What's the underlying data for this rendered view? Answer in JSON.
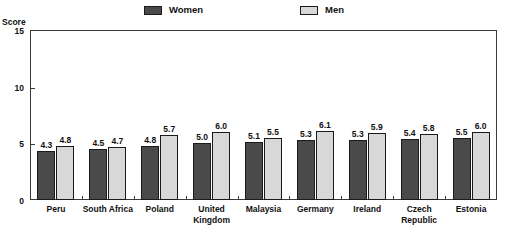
{
  "chart_data": {
    "type": "bar",
    "title": "",
    "subtitle": "",
    "xlabel": "",
    "ylabel": "Score",
    "ylim": [
      0,
      15
    ],
    "yticks": [
      0,
      5,
      10,
      15
    ],
    "ytick_labels": [
      "0",
      "5",
      "10",
      "15"
    ],
    "grid": false,
    "legend_position": "top-center",
    "categories": [
      "Peru",
      "South Africa",
      "Poland",
      "United Kingdom",
      "Malaysia",
      "Germany",
      "Ireland",
      "Czech Republic",
      "Estonia"
    ],
    "category_lines": [
      [
        "Peru"
      ],
      [
        "South Africa"
      ],
      [
        "Poland"
      ],
      [
        "United",
        "Kingdom"
      ],
      [
        "Malaysia"
      ],
      [
        "Germany"
      ],
      [
        "Ireland"
      ],
      [
        "Czech",
        "Republic"
      ],
      [
        "Estonia"
      ]
    ],
    "series": [
      {
        "name": "Women",
        "color": "#4a4a4a",
        "values": [
          4.3,
          4.5,
          4.8,
          5.0,
          5.1,
          5.3,
          5.3,
          5.4,
          5.5
        ],
        "labels": [
          "4.3",
          "4.5",
          "4.8",
          "5.0",
          "5.1",
          "5.3",
          "5.3",
          "5.4",
          "5.5"
        ]
      },
      {
        "name": "Men",
        "color": "#d8d8d8",
        "values": [
          4.8,
          4.7,
          5.7,
          6.0,
          5.5,
          6.1,
          5.9,
          5.8,
          6.0
        ],
        "labels": [
          "4.8",
          "4.7",
          "5.7",
          "6.0",
          "5.5",
          "6.1",
          "5.9",
          "5.8",
          "6.0"
        ]
      }
    ]
  },
  "legend": {
    "entries": [
      {
        "label": "Women",
        "swatch": "dark"
      },
      {
        "label": "Men",
        "swatch": "light"
      }
    ]
  },
  "axis": {
    "y_title": "Score"
  },
  "colors": {
    "women": "#4a4a4a",
    "men": "#d8d8d8",
    "frame": "#3a3a3a",
    "text": "#111111",
    "background": "#ffffff"
  }
}
